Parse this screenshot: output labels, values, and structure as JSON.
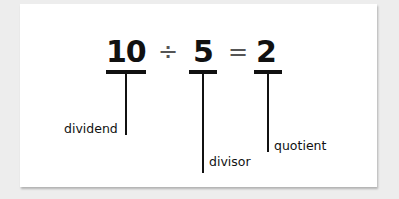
{
  "equation": {
    "dividend": "10",
    "divide_symbol": "÷",
    "divisor": "5",
    "equals_symbol": "=",
    "quotient": "2"
  },
  "labels": {
    "dividend": "dividend",
    "divisor": "divisor",
    "quotient": "quotient"
  },
  "colors": {
    "background": "#ededed",
    "card": "#ffffff",
    "ink": "#111111"
  }
}
